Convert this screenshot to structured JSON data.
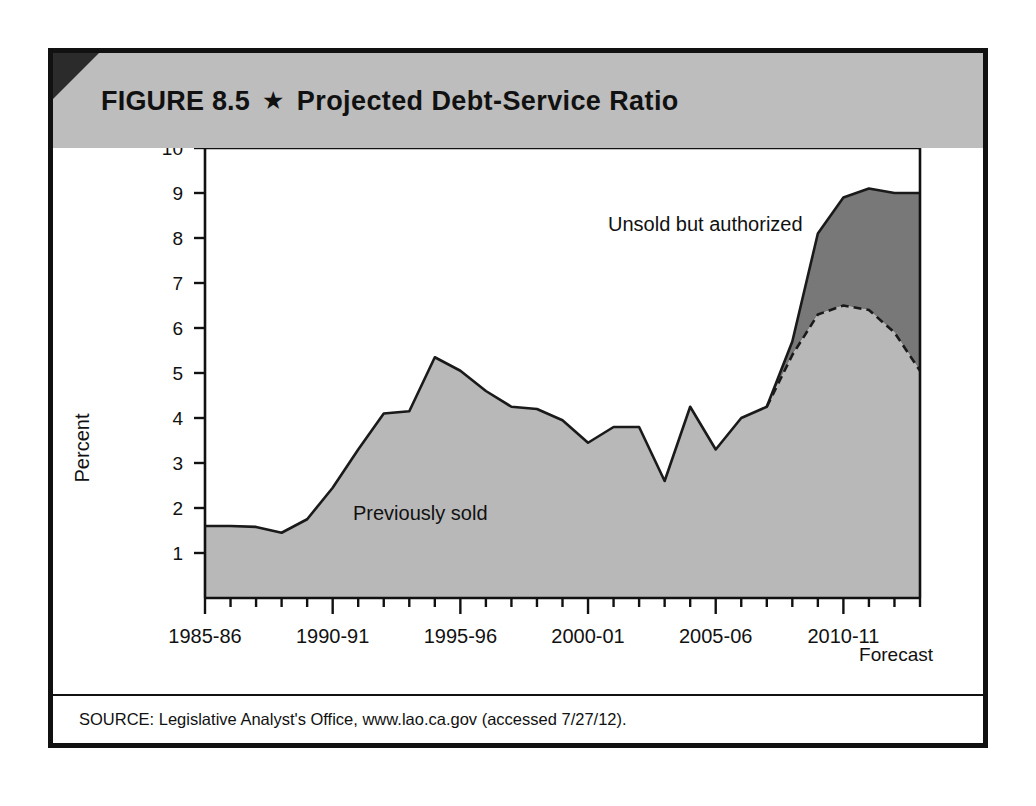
{
  "figure": {
    "number_label": "FIGURE 8.5",
    "star_glyph": "★",
    "title": "Projected Debt-Service Ratio",
    "source_note": "SOURCE: Legislative Analyst's Office, www.lao.ca.gov (accessed 7/27/12)."
  },
  "colors": {
    "header_band": "#bdbdbd",
    "header_corner": "#2b2b2b",
    "frame_border": "#111111",
    "previously_sold_fill": "#b8b8b8",
    "unsold_authorized_fill": "#787878",
    "line_stroke": "#1a1a1a",
    "plot_background": "#ffffff"
  },
  "chart_data": {
    "type": "area",
    "stacked": true,
    "title": "Projected Debt-Service Ratio",
    "xlabel": "",
    "ylabel": "Percent",
    "ylim": [
      0,
      10
    ],
    "ytick_labels": [
      "1",
      "2",
      "3",
      "4",
      "5",
      "6",
      "7",
      "8",
      "9",
      "10"
    ],
    "ytick_values": [
      1,
      2,
      3,
      4,
      5,
      6,
      7,
      8,
      9,
      10
    ],
    "grid": false,
    "legend_position": "inline-annotations",
    "x": [
      "1985-86",
      "1986-87",
      "1987-88",
      "1988-89",
      "1989-90",
      "1990-91",
      "1991-92",
      "1992-93",
      "1993-94",
      "1994-95",
      "1995-96",
      "1996-97",
      "1997-98",
      "1998-99",
      "1999-00",
      "2000-01",
      "2001-02",
      "2002-03",
      "2003-04",
      "2004-05",
      "2005-06",
      "2006-07",
      "2007-08",
      "2008-09",
      "2009-10",
      "2010-11",
      "2011-12",
      "2012-13",
      "2013-14"
    ],
    "xtick_labels": [
      "1985-86",
      "1990-91",
      "1995-96",
      "2000-01",
      "2005-06",
      "2010-11"
    ],
    "xtick_label_indices": [
      0,
      5,
      10,
      15,
      20,
      25
    ],
    "forecast_label": "Forecast",
    "forecast_start_index": 23,
    "series": [
      {
        "name": "Previously sold",
        "annotation": "Previously sold",
        "values": [
          1.6,
          1.6,
          1.58,
          1.45,
          1.75,
          2.45,
          3.3,
          4.1,
          4.15,
          5.35,
          5.05,
          4.6,
          4.25,
          4.2,
          3.95,
          3.45,
          3.8,
          3.8,
          2.6,
          4.25,
          3.3,
          4.0,
          4.25,
          5.4,
          6.3,
          6.5,
          6.4,
          5.9,
          5.05
        ]
      },
      {
        "name": "Unsold but authorized",
        "annotation": "Unsold but authorized",
        "values": [
          0,
          0,
          0,
          0,
          0,
          0,
          0,
          0,
          0,
          0,
          0,
          0,
          0,
          0,
          0,
          0,
          0,
          0,
          0,
          0,
          0,
          0,
          0,
          0.3,
          1.8,
          2.4,
          2.7,
          3.1,
          3.95
        ]
      }
    ],
    "total_values": [
      1.6,
      1.6,
      1.58,
      1.45,
      1.75,
      2.45,
      3.3,
      4.1,
      4.15,
      5.35,
      5.05,
      4.6,
      4.25,
      4.2,
      3.95,
      3.45,
      3.8,
      3.8,
      2.6,
      4.25,
      3.3,
      4.0,
      4.25,
      5.7,
      8.1,
      8.9,
      9.1,
      9.0,
      9.0
    ]
  }
}
